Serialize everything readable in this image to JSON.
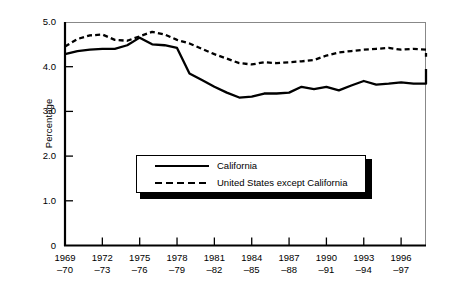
{
  "chart_data": {
    "type": "line",
    "title": "",
    "xlabel": "",
    "ylabel": "Percentage",
    "ylim": [
      0,
      5.0
    ],
    "grid": false,
    "legend_position": "inside-center-lower",
    "y_ticks": [
      "0",
      "1.0",
      "2.0",
      "3.0",
      "4.0",
      "5.0"
    ],
    "y_tick_values": [
      0,
      1.0,
      2.0,
      3.0,
      4.0,
      5.0
    ],
    "x_tick_labels": [
      {
        "line1": "1969",
        "line2": "–70"
      },
      {
        "line1": "1972",
        "line2": "–73"
      },
      {
        "line1": "1975",
        "line2": "–76"
      },
      {
        "line1": "1978",
        "line2": "–79"
      },
      {
        "line1": "1981",
        "line2": "–82"
      },
      {
        "line1": "1984",
        "line2": "–85"
      },
      {
        "line1": "1987",
        "line2": "–88"
      },
      {
        "line1": "1990",
        "line2": "–91"
      },
      {
        "line1": "1993",
        "line2": "–94"
      },
      {
        "line1": "1996",
        "line2": "–97"
      }
    ],
    "x_tick_values": [
      1969,
      1972,
      1975,
      1978,
      1981,
      1984,
      1987,
      1990,
      1993,
      1996
    ],
    "x": [
      1969,
      1970,
      1971,
      1972,
      1973,
      1974,
      1975,
      1976,
      1977,
      1978,
      1979,
      1980,
      1981,
      1982,
      1983,
      1984,
      1985,
      1986,
      1987,
      1988,
      1989,
      1990,
      1991,
      1992,
      1993,
      1994,
      1995,
      1996,
      1997,
      1998
    ],
    "series": [
      {
        "name": "California",
        "style": "solid",
        "color": "#000000",
        "values": [
          4.28,
          4.35,
          4.38,
          4.4,
          4.4,
          4.48,
          4.65,
          4.5,
          4.48,
          4.42,
          3.85,
          3.7,
          3.55,
          3.42,
          3.31,
          3.33,
          3.4,
          3.4,
          3.42,
          3.55,
          3.5,
          3.55,
          3.47,
          3.58,
          3.68,
          3.6,
          3.62,
          3.65,
          3.62,
          3.62
        ]
      },
      {
        "name": "United States except California",
        "style": "dashed",
        "color": "#000000",
        "values": [
          4.45,
          4.62,
          4.7,
          4.72,
          4.6,
          4.58,
          4.68,
          4.78,
          4.72,
          4.6,
          4.52,
          4.4,
          4.28,
          4.18,
          4.08,
          4.05,
          4.1,
          4.08,
          4.1,
          4.12,
          4.15,
          4.25,
          4.32,
          4.35,
          4.38,
          4.4,
          4.42,
          4.38,
          4.4,
          4.38
        ]
      }
    ],
    "series_tail": {
      "california_end": [
        3.65,
        3.78,
        3.95
      ],
      "us_end": [
        4.38,
        4.32,
        4.22
      ]
    }
  },
  "legend": {
    "items": [
      {
        "label": "California",
        "style": "solid"
      },
      {
        "label": "United States except California",
        "style": "dashed"
      }
    ]
  }
}
